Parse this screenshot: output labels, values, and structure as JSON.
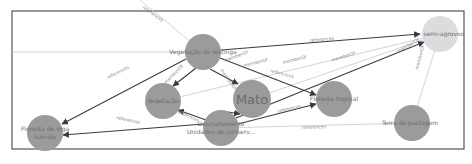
{
  "diagram": {
    "type": "knowledge-graph",
    "nodes": [
      {
        "id": "vegetacao_de_restinga",
        "label": "Vegetação de restinga",
        "x": 203,
        "y": 52,
        "r": 18
      },
      {
        "id": "semi_agrovoo",
        "label": "semi-agrovoo",
        "x": 440,
        "y": 34,
        "r": 18,
        "style": "light"
      },
      {
        "id": "floresta_humida",
        "label_line1": "Floresta de inga",
        "label_line2": "húmida",
        "x": 45,
        "y": 133,
        "r": 18
      },
      {
        "id": "vegetacao",
        "label": "Vegetação",
        "x": 163,
        "y": 101,
        "r": 18
      },
      {
        "id": "mato",
        "label": "Mato",
        "x": 252,
        "y": 99,
        "r": 19
      },
      {
        "id": "floresta_tropical",
        "label": "Floresta tropical",
        "x": 334,
        "y": 99,
        "r": 18
      },
      {
        "id": "terra_de_pastagem",
        "label": "Terra de pastagem",
        "x": 412,
        "y": 123,
        "r": 18
      },
      {
        "id": "desmatamento",
        "label_line1": "Desmatamento",
        "label_line2": "Unidades de conserv...",
        "x": 221,
        "y": 128,
        "r": 18
      }
    ],
    "edges": [
      {
        "from": "vegetacao_de_restinga",
        "to": "semi_agrovoo",
        "label": "references",
        "style": "strong"
      },
      {
        "from": "vegetacao_de_restinga",
        "to": "floresta_humida",
        "label": "references",
        "style": "strong"
      },
      {
        "from": "vegetacao_de_restinga",
        "to": "vegetacao",
        "label": "memberOf",
        "style": "strong"
      },
      {
        "from": "vegetacao_de_restinga",
        "to": "mato",
        "label": "memberOf",
        "style": "strong"
      },
      {
        "from": "vegetacao_de_restinga",
        "to": "floresta_tropical",
        "label": "memberOf",
        "style": "strong"
      },
      {
        "from": "desmatamento",
        "to": "floresta_humida",
        "label": "references",
        "style": "strong"
      },
      {
        "from": "desmatamento",
        "to": "vegetacao",
        "label": "references",
        "style": "strong"
      },
      {
        "from": "desmatamento",
        "to": "mato",
        "label": "references",
        "style": "strong"
      },
      {
        "from": "desmatamento",
        "to": "floresta_tropical",
        "label": "references",
        "style": "strong"
      },
      {
        "from": "desmatamento",
        "to": "semi_agrovoo",
        "label": "memberOf",
        "style": "strong"
      },
      {
        "from": "desmatamento",
        "to": "terra_de_pastagem",
        "label": "references",
        "style": "faint"
      },
      {
        "from": "vegetacao",
        "to": "semi_agrovoo",
        "label": "memberOf",
        "style": "faint"
      },
      {
        "from": "mato",
        "to": "semi_agrovoo",
        "label": "memberOf",
        "style": "faint"
      },
      {
        "from": "floresta_tropical",
        "to": "semi_agrovoo",
        "label": "memberOf",
        "style": "faint"
      },
      {
        "from": "terra_de_pastagem",
        "to": "semi_agrovoo",
        "label": "memberOf",
        "style": "faint"
      }
    ],
    "edge_labels": {
      "top_cut": "references",
      "e1": "references",
      "e2": "references",
      "e3": "memberOf",
      "e4": "memberOf",
      "e5": "memberOf",
      "e6": "references",
      "e7": "references",
      "e8": "references",
      "e9": "references",
      "e10": "memberOf",
      "e11": "references",
      "e12": "memberOf",
      "e13": "memberOf",
      "e14": "memberOf",
      "e15": "memberOf"
    }
  }
}
